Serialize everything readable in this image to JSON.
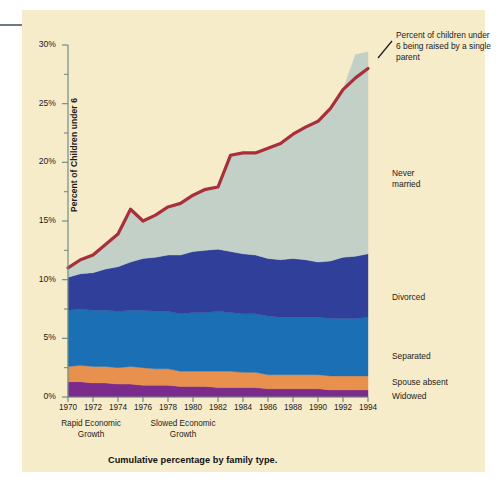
{
  "figure": {
    "caption": "Cumulative percentage by family type.",
    "y_axis_title": "Percent of Children under 6",
    "callout": "Percent of children under 6 being raised by a single parent",
    "era_notes": [
      {
        "line1": "Rapid Economic",
        "line2": "Growth"
      },
      {
        "line1": "Slowed Economic",
        "line2": "Growth"
      }
    ],
    "colors": {
      "panel": "#f7ecc9",
      "axis": "#6f8f86",
      "total_line": "#a82f3c",
      "never_married": "#c2d0c7",
      "divorced": "#2f3f9a",
      "separated": "#1a6fb5",
      "spouse_absent": "#e8904d",
      "widowed": "#7b2b8c",
      "text": "#1b1b1b"
    }
  },
  "chart_data": {
    "type": "area",
    "title": "Cumulative percentage by family type.",
    "xlabel": "",
    "ylabel": "Percent of Children under 6",
    "xlim": [
      1970,
      1994
    ],
    "ylim": [
      0,
      30
    ],
    "ytick_labels": [
      "0%",
      "5%",
      "10%",
      "15%",
      "20%",
      "25%",
      "30%"
    ],
    "ytick_values": [
      0,
      5,
      10,
      15,
      20,
      25,
      30
    ],
    "yminor_step": 2.5,
    "grid": false,
    "legend_position": "right-inline",
    "x": [
      1970,
      1971,
      1972,
      1973,
      1974,
      1975,
      1976,
      1977,
      1978,
      1979,
      1980,
      1981,
      1982,
      1983,
      1984,
      1985,
      1986,
      1987,
      1988,
      1989,
      1990,
      1991,
      1992,
      1993,
      1994
    ],
    "xtick_values": [
      1970,
      1972,
      1974,
      1976,
      1978,
      1980,
      1982,
      1984,
      1986,
      1988,
      1990,
      1992,
      1994
    ],
    "xtick_labels": [
      "1970",
      "1972",
      "1974",
      "1976",
      "1978",
      "1980",
      "1982",
      "1984",
      "1986",
      "1988",
      "1990",
      "1992",
      "1994"
    ],
    "stack_order_bottom_to_top": [
      "widowed",
      "spouse_absent",
      "separated",
      "divorced",
      "never_married"
    ],
    "series": [
      {
        "name": "Widowed",
        "key": "widowed",
        "color": "#7b2b8c",
        "values": [
          1.3,
          1.3,
          1.2,
          1.2,
          1.1,
          1.1,
          1.0,
          1.0,
          1.0,
          0.9,
          0.9,
          0.9,
          0.8,
          0.8,
          0.8,
          0.8,
          0.7,
          0.7,
          0.7,
          0.7,
          0.7,
          0.6,
          0.6,
          0.6,
          0.6
        ]
      },
      {
        "name": "Spouse absent",
        "key": "spouse_absent",
        "color": "#e8904d",
        "values": [
          1.3,
          1.4,
          1.4,
          1.4,
          1.4,
          1.5,
          1.5,
          1.4,
          1.4,
          1.3,
          1.3,
          1.3,
          1.4,
          1.4,
          1.3,
          1.3,
          1.2,
          1.2,
          1.2,
          1.2,
          1.2,
          1.2,
          1.2,
          1.2,
          1.2
        ]
      },
      {
        "name": "Separated",
        "key": "separated",
        "color": "#1a6fb5",
        "values": [
          4.8,
          4.8,
          4.8,
          4.8,
          4.8,
          4.8,
          4.9,
          4.9,
          4.9,
          4.9,
          5.0,
          5.0,
          5.1,
          5.0,
          5.0,
          5.0,
          5.0,
          4.9,
          4.9,
          4.9,
          4.9,
          4.9,
          4.9,
          4.9,
          5.0
        ]
      },
      {
        "name": "Divorced",
        "key": "divorced",
        "color": "#2f3f9a",
        "values": [
          2.8,
          3.0,
          3.2,
          3.5,
          3.8,
          4.1,
          4.4,
          4.6,
          4.8,
          5.0,
          5.2,
          5.3,
          5.3,
          5.2,
          5.1,
          5.0,
          4.9,
          4.9,
          5.0,
          4.9,
          4.7,
          4.9,
          5.2,
          5.3,
          5.4
        ]
      },
      {
        "name": "Never married",
        "key": "never_married",
        "color": "#c2d0c7",
        "values": [
          0.8,
          1.2,
          1.5,
          2.1,
          2.8,
          4.5,
          3.2,
          3.6,
          4.1,
          4.4,
          4.8,
          5.2,
          5.3,
          8.2,
          8.6,
          8.7,
          9.4,
          9.9,
          10.6,
          11.3,
          12.0,
          13.0,
          14.3,
          17.2,
          17.2
        ]
      }
    ],
    "total_line": {
      "name": "Percent of children under 6 being raised by a single parent",
      "color": "#a82f3c",
      "values": [
        11.0,
        11.7,
        12.1,
        13.0,
        13.9,
        16.0,
        15.0,
        15.5,
        16.2,
        16.5,
        17.2,
        17.7,
        17.9,
        20.6,
        20.8,
        20.8,
        21.2,
        21.6,
        22.4,
        23.0,
        23.5,
        24.6,
        26.2,
        27.2,
        28.0
      ]
    },
    "annotations": [
      {
        "text": "Rapid Economic Growth",
        "x_center": 1971
      },
      {
        "text": "Slowed Economic Growth",
        "x_center": 1977
      }
    ]
  }
}
